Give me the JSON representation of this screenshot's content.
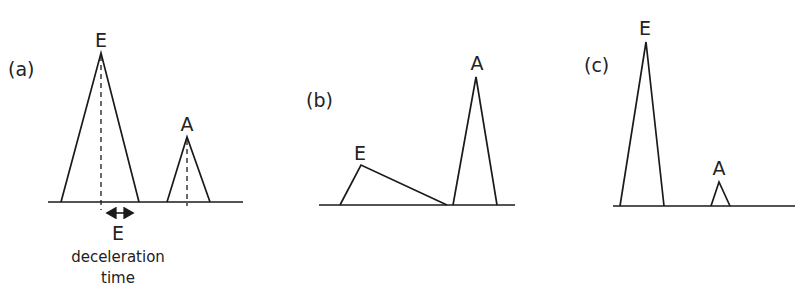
{
  "figure": {
    "panels": [
      {
        "id": "a",
        "label": "(a)",
        "peaks": [
          {
            "name": "E",
            "label": "E",
            "height": "tall",
            "has_dashed_center": true
          },
          {
            "name": "A",
            "label": "A",
            "height": "short",
            "has_dashed_center": true
          }
        ],
        "annotation": {
          "arrow_label": "E",
          "text_line1": "deceleration",
          "text_line2": "time"
        }
      },
      {
        "id": "b",
        "label": "(b)",
        "peaks": [
          {
            "name": "E",
            "label": "E",
            "height": "short",
            "shape": "prolonged deceleration"
          },
          {
            "name": "A",
            "label": "A",
            "height": "tall"
          }
        ]
      },
      {
        "id": "c",
        "label": "(c)",
        "peaks": [
          {
            "name": "E",
            "label": "E",
            "height": "very tall",
            "shape": "narrow"
          },
          {
            "name": "A",
            "label": "A",
            "height": "very small"
          }
        ]
      }
    ],
    "colors": {
      "stroke": "#1a1a1a",
      "text": "#222222",
      "background": "#ffffff"
    }
  }
}
